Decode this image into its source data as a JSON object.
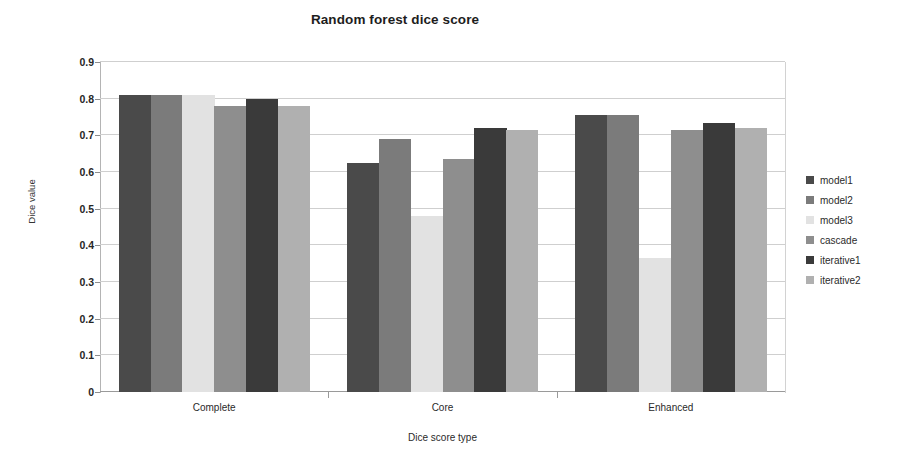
{
  "chart_data": {
    "type": "bar",
    "title": "Random forest dice score",
    "xlabel": "Dice score type",
    "ylabel": "Dice value",
    "categories": [
      "Complete",
      "Core",
      "Enhanced"
    ],
    "ylim": [
      0,
      0.9
    ],
    "ytick_labels": [
      "0",
      "0.1",
      "0.2",
      "0.3",
      "0.4",
      "0.5",
      "0.6",
      "0.7",
      "0.8",
      "0.9"
    ],
    "ytick_values": [
      0,
      0.1,
      0.2,
      0.3,
      0.4,
      0.5,
      0.6,
      0.7,
      0.8,
      0.9
    ],
    "grid": true,
    "legend_position": "right",
    "series": [
      {
        "name": "model1",
        "color": "#4a4a4a",
        "values": [
          0.81,
          0.625,
          0.755
        ]
      },
      {
        "name": "model2",
        "color": "#7b7b7b",
        "values": [
          0.81,
          0.69,
          0.755
        ]
      },
      {
        "name": "model3",
        "color": "#e2e2e2",
        "values": [
          0.81,
          0.48,
          0.365
        ]
      },
      {
        "name": "cascade",
        "color": "#8e8e8e",
        "values": [
          0.78,
          0.635,
          0.715
        ]
      },
      {
        "name": "iterative1",
        "color": "#3a3a3a",
        "values": [
          0.8,
          0.72,
          0.735
        ]
      },
      {
        "name": "iterative2",
        "color": "#b0b0b0",
        "values": [
          0.78,
          0.715,
          0.72
        ]
      }
    ]
  },
  "legend": {
    "items": [
      {
        "label": "model1"
      },
      {
        "label": "model2"
      },
      {
        "label": "model3"
      },
      {
        "label": "cascade"
      },
      {
        "label": "iterative1"
      },
      {
        "label": "iterative2"
      }
    ]
  }
}
